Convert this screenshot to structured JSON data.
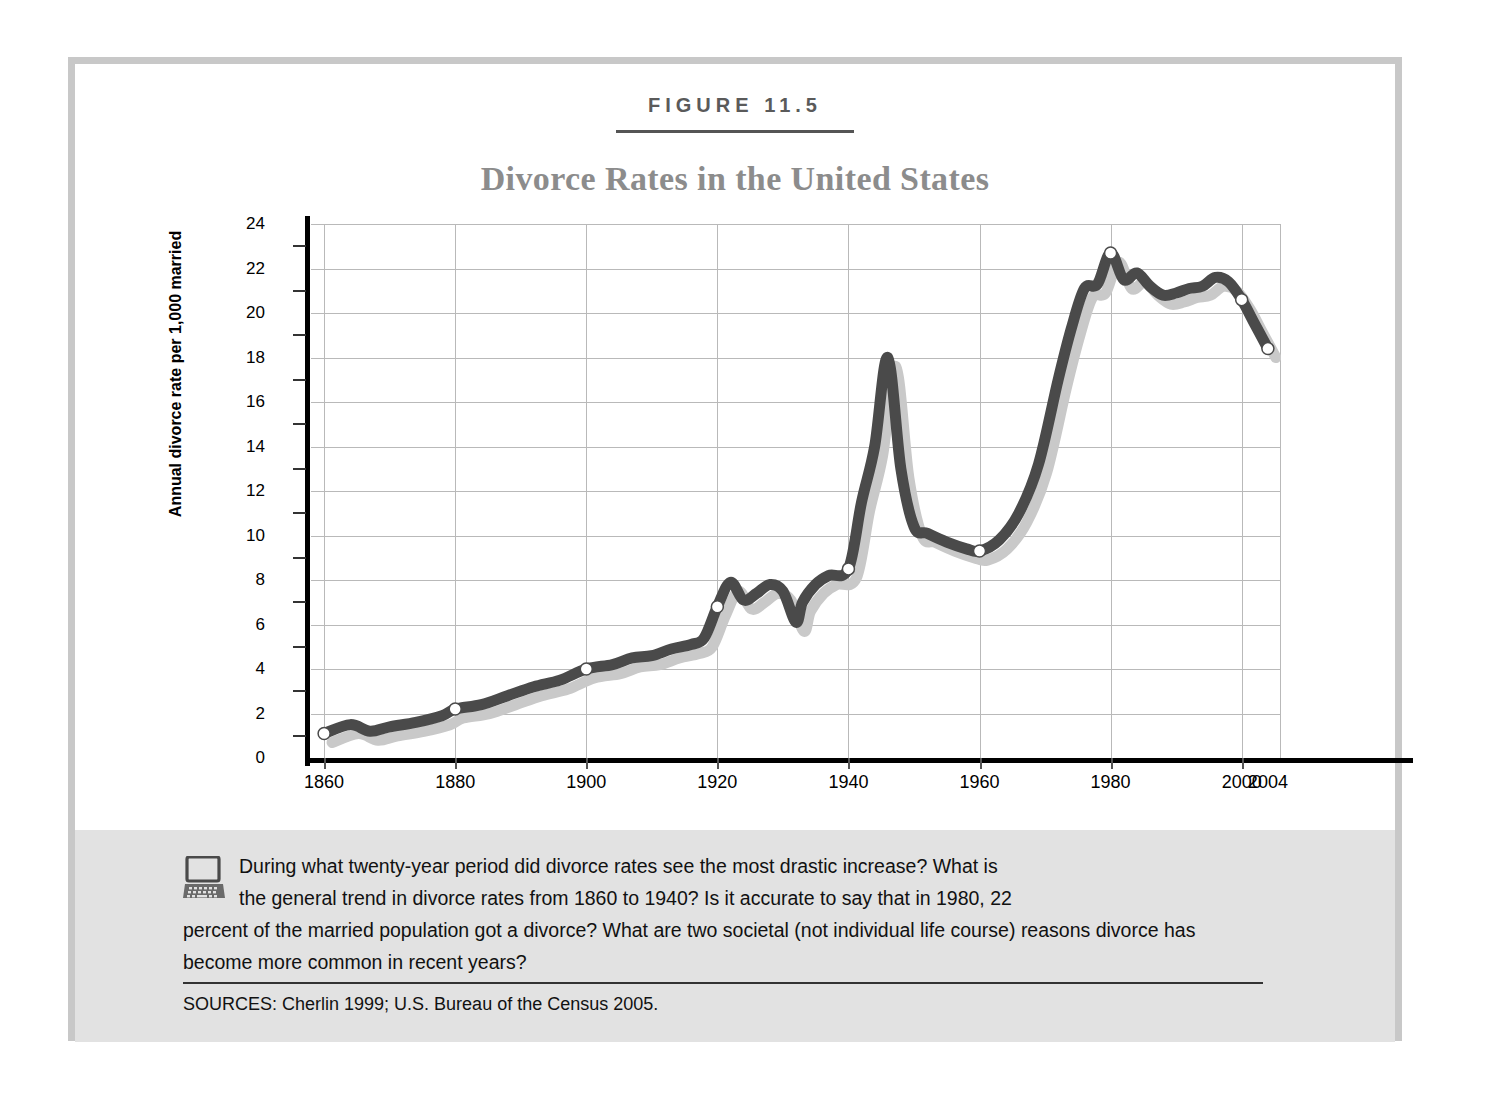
{
  "figure": {
    "label": "FIGURE 11.5",
    "title": "Divorce Rates in the United States"
  },
  "caption": {
    "icon": "computer-icon",
    "line1": "During what twenty-year period did divorce rates see the most drastic increase? What is",
    "line2": "the general trend in divorce rates from 1860 to 1940? Is it accurate to say that in 1980, 22",
    "line3": "percent of the married population got a divorce? What are two societal (not individual life course)",
    "line4": "reasons divorce has become more common in recent years?",
    "sources": "SOURCES: Cherlin 1999; U.S. Bureau of the Census 2005."
  },
  "colors": {
    "line": "#4a4a4a",
    "shadow": "#c9c9c9",
    "grid": "#b9b9b9",
    "axis": "#000000",
    "title": "#8c8c8c",
    "label": "#5a5a5a",
    "frame": "#c8c8c8",
    "band": "#e2e2e2"
  },
  "chart_data": {
    "type": "line",
    "title": "Divorce Rates in the United States",
    "xlabel": "",
    "ylabel": "Annual divorce rate per 1,000 married",
    "xlim": [
      1858,
      2006
    ],
    "ylim": [
      0,
      24
    ],
    "ytick_step": 2,
    "grid": true,
    "legend": "none",
    "minor_ticks_y": [
      1,
      3,
      5,
      7,
      9,
      11,
      13,
      15,
      17,
      19,
      21,
      23
    ],
    "yticks": [
      0,
      2,
      4,
      6,
      8,
      10,
      12,
      14,
      16,
      18,
      20,
      22,
      24
    ],
    "xticks": [
      1860,
      1880,
      1900,
      1920,
      1940,
      1960,
      1980,
      2000,
      2004
    ],
    "xtick_labels": [
      "1860",
      "1880",
      "1900",
      "1920",
      "1940",
      "1960",
      "1980",
      "2000",
      "2004"
    ],
    "marker_points": [
      {
        "x": 1860,
        "y": 1.1
      },
      {
        "x": 1880,
        "y": 2.2
      },
      {
        "x": 1900,
        "y": 4.0
      },
      {
        "x": 1920,
        "y": 6.8
      },
      {
        "x": 1940,
        "y": 8.5
      },
      {
        "x": 1960,
        "y": 9.3
      },
      {
        "x": 1980,
        "y": 22.7
      },
      {
        "x": 2000,
        "y": 20.6
      },
      {
        "x": 2004,
        "y": 18.4
      }
    ],
    "series": [
      {
        "name": "Annual divorce rate per 1,000 married women",
        "x": [
          1860,
          1864,
          1867,
          1870,
          1874,
          1878,
          1880,
          1884,
          1888,
          1892,
          1896,
          1900,
          1904,
          1907,
          1910,
          1913,
          1916,
          1918,
          1920,
          1922,
          1924,
          1926,
          1928,
          1930,
          1932,
          1933,
          1935,
          1937,
          1940,
          1942,
          1944,
          1946,
          1948,
          1950,
          1952,
          1955,
          1958,
          1960,
          1963,
          1966,
          1969,
          1972,
          1974,
          1976,
          1978,
          1980,
          1982,
          1984,
          1986,
          1988,
          1990,
          1992,
          1994,
          1996,
          1998,
          2000,
          2002,
          2004
        ],
        "y": [
          1.1,
          1.5,
          1.2,
          1.4,
          1.6,
          1.9,
          2.2,
          2.4,
          2.8,
          3.2,
          3.5,
          4.0,
          4.2,
          4.5,
          4.6,
          4.9,
          5.1,
          5.4,
          6.8,
          7.9,
          7.1,
          7.4,
          7.8,
          7.5,
          6.1,
          7.0,
          7.8,
          8.2,
          8.5,
          11.5,
          14.0,
          18.0,
          13.0,
          10.4,
          10.1,
          9.7,
          9.4,
          9.3,
          9.8,
          11.0,
          13.2,
          17.0,
          19.3,
          21.1,
          21.3,
          22.7,
          21.5,
          21.8,
          21.2,
          20.8,
          20.9,
          21.1,
          21.2,
          21.6,
          21.4,
          20.6,
          19.5,
          18.4
        ]
      }
    ]
  }
}
